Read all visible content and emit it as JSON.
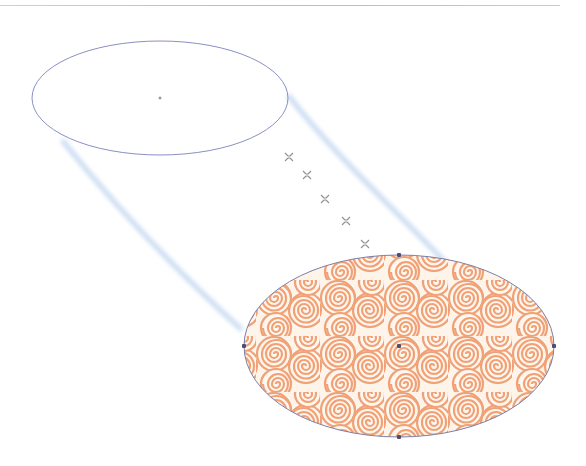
{
  "canvas": {
    "width": 586,
    "height": 466,
    "background": "#ffffff"
  },
  "colors": {
    "ellipse_stroke": "#8a8fc4",
    "anchor": "#4b4f78",
    "pattern_stroke": "#f0a176",
    "pattern_bg": "#fff6ee",
    "blend_streak": "#c9dcf2",
    "step_marker": "#8f8f96"
  },
  "top_ellipse": {
    "cx": 160,
    "cy": 98,
    "rx": 128,
    "ry": 57,
    "center_marker": [
      160,
      98
    ]
  },
  "bottom_ellipse": {
    "cx": 399,
    "cy": 346,
    "rx": 155,
    "ry": 91,
    "fill": "orange-swirl-pattern",
    "anchors": [
      [
        399,
        255
      ],
      [
        244,
        346
      ],
      [
        554,
        346
      ],
      [
        399,
        437
      ],
      [
        399,
        346
      ]
    ]
  },
  "blend_steps": [
    [
      289,
      157
    ],
    [
      307,
      175
    ],
    [
      325,
      199
    ],
    [
      346,
      221
    ],
    [
      365,
      244
    ]
  ],
  "blend_edges": [
    {
      "from": [
        62,
        140
      ],
      "to": [
        242,
        330
      ]
    },
    {
      "from": [
        288,
        95
      ],
      "to": [
        445,
        262
      ]
    }
  ]
}
